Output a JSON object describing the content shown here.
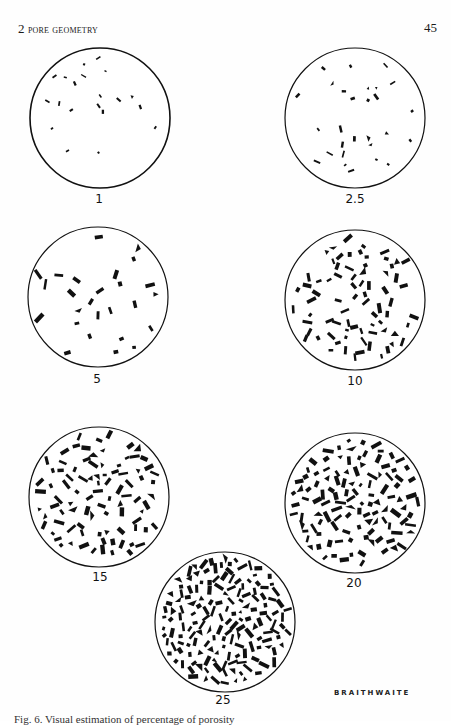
{
  "header": {
    "chapter_number": "2",
    "chapter_title": "Pore Geometry",
    "page_number": "45"
  },
  "figure": {
    "circle_radius": 70,
    "ink_color": "#111111",
    "panels": [
      {
        "label": "1",
        "percent": 1,
        "cx": 100,
        "cy": 118,
        "label_x": 99,
        "label_y": 192,
        "pore_count": 20,
        "pore_size": 2.2,
        "seed": 11
      },
      {
        "label": "2.5",
        "percent": 2.5,
        "cx": 355,
        "cy": 118,
        "label_x": 355,
        "label_y": 192,
        "pore_count": 28,
        "pore_size": 2.8,
        "seed": 23
      },
      {
        "label": "5",
        "percent": 5,
        "cx": 98,
        "cy": 297,
        "label_x": 97,
        "label_y": 372,
        "pore_count": 26,
        "pore_size": 4.2,
        "seed": 37
      },
      {
        "label": "10",
        "percent": 10,
        "cx": 355,
        "cy": 300,
        "label_x": 355,
        "label_y": 374,
        "pore_count": 75,
        "pore_size": 3.9,
        "seed": 41
      },
      {
        "label": "15",
        "percent": 15,
        "cx": 99,
        "cy": 497,
        "label_x": 100,
        "label_y": 570,
        "pore_count": 90,
        "pore_size": 4.3,
        "seed": 53
      },
      {
        "label": "20",
        "percent": 20,
        "cx": 355,
        "cy": 503,
        "label_x": 354,
        "label_y": 576,
        "pore_count": 115,
        "pore_size": 4.4,
        "seed": 67
      },
      {
        "label": "25",
        "percent": 25,
        "cx": 225,
        "cy": 622,
        "label_x": 223,
        "label_y": 693,
        "pore_count": 160,
        "pore_size": 4.2,
        "seed": 79
      }
    ],
    "artist_credit": "BRAITHWAITE"
  },
  "caption": {
    "text": "Fig. 6. Visual estimation of percentage of porosity"
  }
}
